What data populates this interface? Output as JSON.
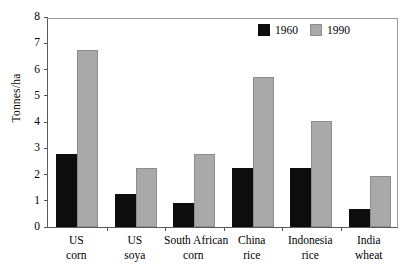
{
  "chart_data": {
    "type": "bar",
    "title": "",
    "xlabel": "",
    "ylabel": "Tonnes/ha",
    "ylim": [
      0,
      8
    ],
    "yticks": [
      0,
      1,
      2,
      3,
      4,
      5,
      6,
      7,
      8
    ],
    "grid": false,
    "legend_position": "top-right",
    "categories": [
      "US corn",
      "US soya",
      "South African corn",
      "China rice",
      "Indonesia rice",
      "India wheat"
    ],
    "category_lines": [
      [
        "US",
        "corn"
      ],
      [
        "US",
        "soya"
      ],
      [
        "South African",
        "corn"
      ],
      [
        "China",
        "rice"
      ],
      [
        "Indonesia",
        "rice"
      ],
      [
        "India",
        "wheat"
      ]
    ],
    "series": [
      {
        "name": "1960",
        "color": "#0d0d0d",
        "values": [
          2.8,
          1.25,
          0.9,
          2.25,
          2.25,
          0.7
        ]
      },
      {
        "name": "1990",
        "color": "#a9a9a9",
        "values": [
          6.75,
          2.25,
          2.8,
          5.7,
          4.05,
          1.95
        ]
      }
    ]
  },
  "axis": {
    "y_title": "Tonnes/ha",
    "y_tick_labels": [
      "0",
      "1",
      "2",
      "3",
      "4",
      "5",
      "6",
      "7",
      "8"
    ]
  },
  "legend": {
    "items": [
      {
        "label": "1960",
        "swatch": "black-square-swatch"
      },
      {
        "label": "1990",
        "swatch": "gray-square-swatch"
      }
    ]
  }
}
